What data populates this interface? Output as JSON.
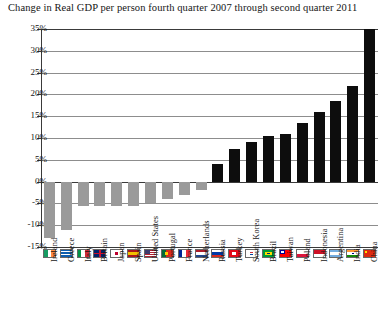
{
  "chart_data": {
    "type": "bar",
    "title": "Change in Real GDP per person fourth quarter 2007 through second quarter 2011",
    "xlabel": "",
    "ylabel": "",
    "ylim": [
      -15,
      35
    ],
    "ytick_labels": [
      "35%",
      "30%",
      "25%",
      "20%",
      "15%",
      "10%",
      "5%",
      "0%",
      "-5%",
      "-10%",
      "-15%"
    ],
    "ytick_values": [
      35,
      30,
      25,
      20,
      15,
      10,
      5,
      0,
      -5,
      -10,
      -15
    ],
    "grid": true,
    "legend": "none",
    "categories": [
      "Ireland",
      "Greece",
      "Italy",
      "Britain",
      "Japan",
      "Spain",
      "United States",
      "Portugal",
      "France",
      "Netherlands",
      "Russia",
      "Turkey",
      "South Korea",
      "Brazil",
      "Taiwan",
      "Poland",
      "Indonesia",
      "Argentina",
      "India",
      "China"
    ],
    "values": [
      -13,
      -11,
      -5.5,
      -5.5,
      -5.5,
      -5.5,
      -5,
      -4,
      -3,
      -2,
      4,
      7.5,
      9,
      10.5,
      11,
      13.5,
      16,
      18.5,
      22,
      35
    ],
    "colors": {
      "negative_bar": "#9a9a9a",
      "positive_bar": "#0d0d0d",
      "gridline": "#8d8d8d",
      "axis": "#3a3a3a",
      "background": "#ffffff",
      "text": "#151515"
    },
    "flags": [
      {
        "country": "Ireland",
        "icon": "flag-ireland"
      },
      {
        "country": "Greece",
        "icon": "flag-greece"
      },
      {
        "country": "Italy",
        "icon": "flag-italy"
      },
      {
        "country": "Britain",
        "icon": "flag-britain"
      },
      {
        "country": "Japan",
        "icon": "flag-japan"
      },
      {
        "country": "Spain",
        "icon": "flag-spain"
      },
      {
        "country": "United States",
        "icon": "flag-united-states"
      },
      {
        "country": "Portugal",
        "icon": "flag-portugal"
      },
      {
        "country": "France",
        "icon": "flag-france"
      },
      {
        "country": "Netherlands",
        "icon": "flag-netherlands"
      },
      {
        "country": "Russia",
        "icon": "flag-russia"
      },
      {
        "country": "Turkey",
        "icon": "flag-turkey"
      },
      {
        "country": "South Korea",
        "icon": "flag-south-korea"
      },
      {
        "country": "Brazil",
        "icon": "flag-brazil"
      },
      {
        "country": "Taiwan",
        "icon": "flag-taiwan"
      },
      {
        "country": "Poland",
        "icon": "flag-poland"
      },
      {
        "country": "Indonesia",
        "icon": "flag-indonesia"
      },
      {
        "country": "Argentina",
        "icon": "flag-argentina"
      },
      {
        "country": "India",
        "icon": "flag-india"
      },
      {
        "country": "China",
        "icon": "flag-china"
      }
    ]
  }
}
